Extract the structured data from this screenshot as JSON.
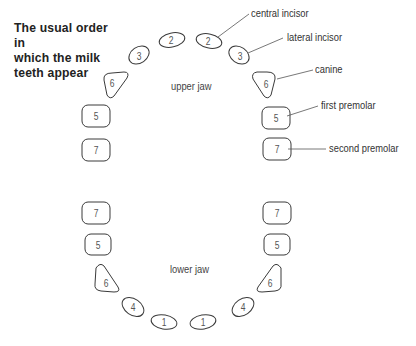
{
  "title": "The usual order in which the milk teeth appear",
  "title_lines": [
    "The usual order in",
    "which the milk",
    "teeth appear"
  ],
  "labels": {
    "upper_jaw": "upper jaw",
    "lower_jaw": "lower jaw"
  },
  "callouts": {
    "central_incisor": "central incisor",
    "lateral_incisor": "lateral incisor",
    "canine": "canine",
    "first_premolar": "first premolar",
    "second_premolar": "second premolar"
  },
  "teeth": {
    "upper": {
      "left_second_premolar": "7",
      "left_first_premolar": "5",
      "left_canine": "6",
      "left_lateral_incisor": "3",
      "left_central_incisor": "2",
      "right_central_incisor": "2",
      "right_lateral_incisor": "3",
      "right_canine": "6",
      "right_first_premolar": "5",
      "right_second_premolar": "7"
    },
    "lower": {
      "left_second_premolar": "7",
      "left_first_premolar": "5",
      "left_canine": "6",
      "left_lateral_incisor": "4",
      "left_central_incisor": "1",
      "right_central_incisor": "1",
      "right_lateral_incisor": "4",
      "right_canine": "6",
      "right_first_premolar": "5",
      "right_second_premolar": "7"
    }
  },
  "colors": {
    "outline": "#3a3a3a",
    "text": "#333333",
    "background": "#ffffff"
  }
}
